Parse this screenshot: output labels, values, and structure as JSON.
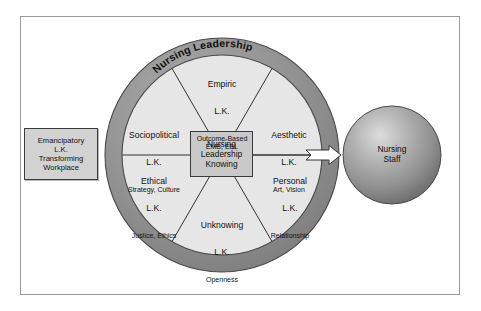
{
  "diagram": {
    "title_ring": "Nursing Leadership",
    "center": {
      "line1": "Nursing",
      "line2": "Leadership",
      "line3": "Knowing"
    },
    "emancipatory": {
      "line1": "Emancipatory",
      "line2": "L.K.",
      "line3": "Transforming",
      "line4": "Workplace"
    },
    "staff": {
      "line1": "Nursing",
      "line2": "Staff"
    },
    "segments": [
      {
        "id": "empiric",
        "name": "Empiric",
        "lk": "L.K.",
        "detail": "Outcome-Based\nEMB, EBL"
      },
      {
        "id": "aesthetic",
        "name": "Aesthetic",
        "lk": "L.K.",
        "detail": "Art, Vision"
      },
      {
        "id": "personal",
        "name": "Personal",
        "lk": "L.K.",
        "detail": "Relationship"
      },
      {
        "id": "unknowing",
        "name": "Unknowing",
        "lk": "L.K.",
        "detail": "Openness"
      },
      {
        "id": "ethical",
        "name": "Ethical",
        "lk": "L.K.",
        "detail": "Justice, Ethics"
      },
      {
        "id": "sociopolitical",
        "name": "Sociopolitical",
        "lk": "L.K.",
        "detail": "Strategy, Culture"
      }
    ],
    "colors": {
      "ring_fill": "#8f8f8f",
      "ring_edge": "#4a4a4a",
      "inner_fill": "#e6e6e6",
      "box_fill": "#d2d2d2",
      "center_fill": "#c9c9c9",
      "sphere_fill": "#8c8c8c",
      "sphere_highlight": "#d8d8d8",
      "line": "#333333",
      "frame": "#9a9a9a",
      "text": "#111111",
      "arrow_fill": "#ffffff"
    }
  }
}
